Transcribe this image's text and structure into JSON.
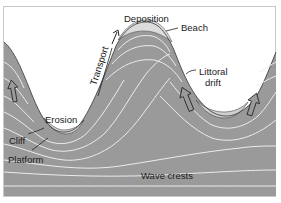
{
  "diagram": {
    "labels": {
      "deposition": "Deposition",
      "beach": "Beach",
      "transport": "Transport",
      "littoral_drift_line1": "Littoral",
      "littoral_drift_line2": "drift",
      "erosion": "Erosion",
      "cliff": "Cliff",
      "platform": "Platform",
      "wave_crests": "Wave crests"
    },
    "colors": {
      "sea": "#9a9a9a",
      "land": "#ffffff",
      "wave_crest_lines": "#ececec",
      "frame": "#c8c8c8",
      "ink": "#1a1a1a"
    },
    "arrows": [
      {
        "name": "wave-direction-arrow-left",
        "direction": "up"
      },
      {
        "name": "wave-direction-arrow-center",
        "direction": "up-left"
      },
      {
        "name": "wave-direction-arrow-right",
        "direction": "up"
      },
      {
        "name": "transport-arrow",
        "direction": "up-right along headland"
      }
    ]
  }
}
